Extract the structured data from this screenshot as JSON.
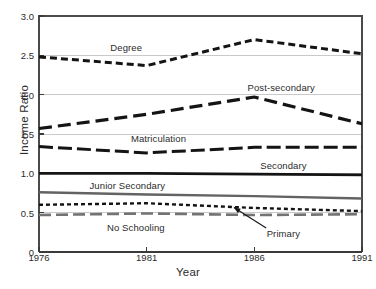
{
  "chart_data": {
    "type": "line",
    "title": "",
    "xlabel": "Year",
    "ylabel": "Income Ratio",
    "x": [
      1976,
      1981,
      1986,
      1991
    ],
    "xtick_labels": [
      "1976",
      "1981",
      "1986",
      "1991"
    ],
    "ytick_labels": [
      "0",
      "0.5",
      "1.0",
      "1.5",
      "2.0",
      "2.5",
      "3.0"
    ],
    "ytick_values": [
      0,
      0.5,
      1.0,
      1.5,
      2.0,
      2.5,
      3.0
    ],
    "xlim": [
      1976,
      1991
    ],
    "ylim": [
      0,
      3.0
    ],
    "grid": "horizontal",
    "legend_position": "inline-annotations",
    "series": [
      {
        "name": "Degree",
        "values": [
          2.48,
          2.37,
          2.7,
          2.52
        ],
        "color": "#141414",
        "dash": "7,4",
        "width": 3.0,
        "label_x": 1980.05,
        "label_y": 2.6
      },
      {
        "name": "Post-secondary",
        "values": [
          1.57,
          1.75,
          1.97,
          1.63
        ],
        "color": "#141414",
        "dash": "13,6",
        "width": 3.2,
        "label_x": 1987.25,
        "label_y": 2.1
      },
      {
        "name": "Matriculation",
        "values": [
          1.34,
          1.26,
          1.33,
          1.33
        ],
        "color": "#141414",
        "dash": "14,5",
        "width": 3.0,
        "label_x": 1981.55,
        "label_y": 1.45
      },
      {
        "name": "Secondary",
        "values": [
          1.0,
          1.0,
          0.99,
          0.98
        ],
        "color": "#141414",
        "dash": "none",
        "width": 2.6,
        "label_x": 1987.35,
        "label_y": 1.11
      },
      {
        "name": "Junior Secondary",
        "values": [
          0.76,
          0.73,
          0.71,
          0.68
        ],
        "color": "#636363",
        "dash": "none",
        "width": 2.4,
        "label_x": 1980.1,
        "label_y": 0.855
      },
      {
        "name": "Primary",
        "values": [
          0.6,
          0.62,
          0.56,
          0.52
        ],
        "color": "#141414",
        "dash": "4,3",
        "width": 2.4,
        "label_x": 1987.35,
        "label_y": 0.245,
        "annotation_arrow": {
          "from_x": 1986.55,
          "from_y": 0.305,
          "to_x": 1985.05,
          "to_y": 0.565
        }
      },
      {
        "name": "No Schooling",
        "values": [
          0.47,
          0.49,
          0.47,
          0.48
        ],
        "color": "#737373",
        "dash": "12,5",
        "width": 2.6,
        "label_x": 1980.5,
        "label_y": 0.315
      }
    ],
    "colors": {
      "axis": "#3a3a3a",
      "grid": "#c9c9c9",
      "frame": "#4a4a4a",
      "text": "#2b2b2b",
      "background": "#ffffff"
    }
  }
}
